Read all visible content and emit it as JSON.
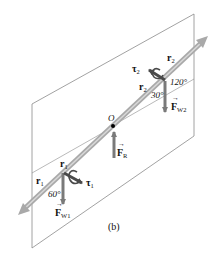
{
  "figure": {
    "caption": "(b)",
    "origin_label": "O",
    "colors": {
      "plane_edge": "#8a8a8a",
      "rod": "#b0b0b0",
      "rod_light": "#d6d6d6",
      "force_arrow": "#7a7a7a",
      "torque_arrow": "#5a5a5a",
      "text": "#111111"
    },
    "joint2": {
      "r_upper": {
        "main": "r",
        "sub": "2"
      },
      "r_lower": {
        "main": "r",
        "sub": "2"
      },
      "tau": {
        "main": "τ",
        "sub": "2"
      },
      "force": {
        "main": "F",
        "sub": "W2"
      },
      "angle_top": "120°",
      "angle_bottom": "30°"
    },
    "joint1": {
      "r_upper": {
        "main": "r",
        "sub": "1"
      },
      "r_left": {
        "main": "r",
        "sub": "1"
      },
      "tau": {
        "main": "τ",
        "sub": "1"
      },
      "force": {
        "main": "F",
        "sub": "W1"
      },
      "angle": "60°"
    },
    "center": {
      "force": {
        "main": "F",
        "sub": "R"
      }
    }
  }
}
